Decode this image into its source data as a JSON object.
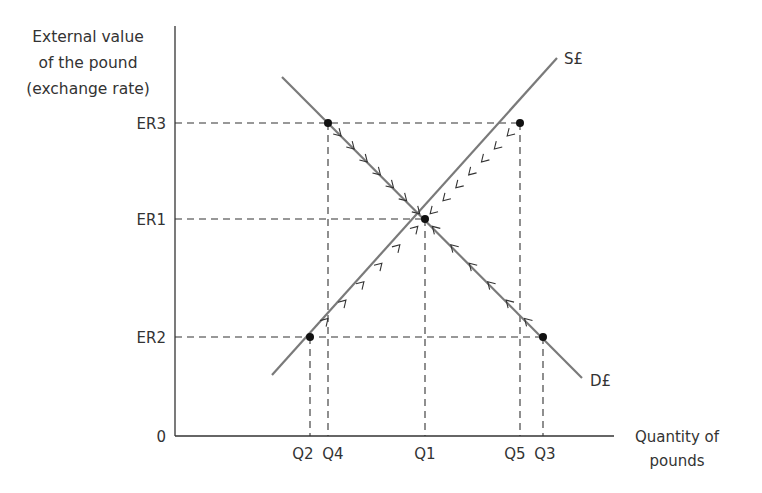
{
  "chart_data": {
    "type": "line",
    "title": "",
    "ylabel": [
      "External value",
      "of the pound",
      "(exchange rate)"
    ],
    "xlabel": [
      "Quantity of",
      "pounds"
    ],
    "origin_label": "0",
    "y_ticks": [
      "ER3",
      "ER1",
      "ER2"
    ],
    "x_ticks": [
      "Q2",
      "Q4",
      "Q1",
      "Q5",
      "Q3"
    ],
    "series": [
      {
        "name": "S£",
        "kind": "supply",
        "direction": "upward-sloping",
        "points": [
          [
            "Q2",
            "ER2"
          ],
          [
            "Q1",
            "ER1"
          ],
          [
            "Q5",
            "ER3"
          ]
        ]
      },
      {
        "name": "D£",
        "kind": "demand",
        "direction": "downward-sloping",
        "points": [
          [
            "Q4",
            "ER3"
          ],
          [
            "Q1",
            "ER1"
          ],
          [
            "Q3",
            "ER2"
          ]
        ]
      }
    ],
    "equilibrium": {
      "x": "Q1",
      "y": "ER1"
    },
    "annotations": [
      "At ER3: demand Q4 < supply Q5 (surplus), arrows move rate down to ER1",
      "At ER2: supply Q2 < demand Q3 (shortage), arrows move rate up to ER1"
    ],
    "grid": false
  },
  "labels": {
    "y_title_1": "External value",
    "y_title_2": "of the pound",
    "y_title_3": "(exchange rate)",
    "x_title_1": "Quantity of",
    "x_title_2": "pounds",
    "origin": "0",
    "er3": "ER3",
    "er1": "ER1",
    "er2": "ER2",
    "q2": "Q2",
    "q4": "Q4",
    "q1": "Q1",
    "q5": "Q5",
    "q3": "Q3",
    "supply": "S£",
    "demand": "D£"
  },
  "colors": {
    "curve": "#7a7a7a",
    "axis": "#333333",
    "dashed": "#333333",
    "point": "#111111"
  }
}
